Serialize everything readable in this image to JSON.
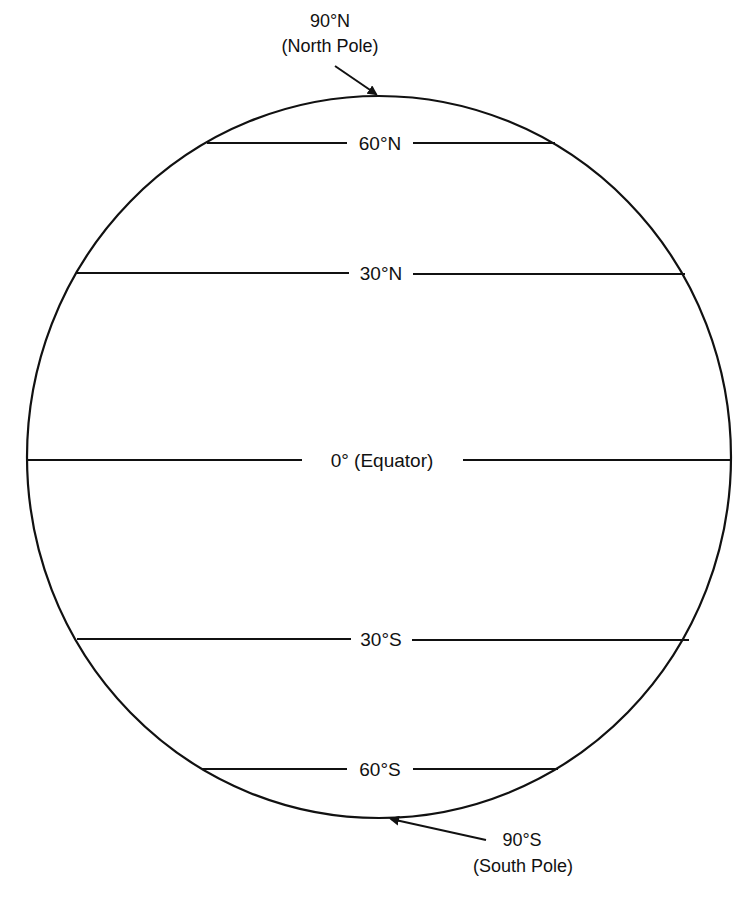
{
  "diagram": {
    "type": "globe-latitude-lines",
    "colors": {
      "stroke": "#111111",
      "background": "#ffffff"
    },
    "globe": {
      "cx": 379,
      "cy": 457,
      "rx": 352,
      "ry": 361
    },
    "north_pole": {
      "degree_label": "90°N",
      "name_label": "(North Pole)"
    },
    "south_pole": {
      "degree_label": "90°S",
      "name_label": "(South Pole)"
    },
    "latitudes": [
      {
        "id": "60n",
        "label": "60°N",
        "y": 143,
        "x1": 207,
        "x2": 555
      },
      {
        "id": "30n",
        "label": "30°N",
        "y": 273,
        "x1": 77,
        "x2": 685
      },
      {
        "id": "eq",
        "label": "0° (Equator)",
        "y": 460,
        "x1": 27,
        "x2": 731
      },
      {
        "id": "30s",
        "label": "30°S",
        "y": 639,
        "x1": 77,
        "x2": 689
      },
      {
        "id": "60s",
        "label": "60°S",
        "y": 769,
        "x1": 202,
        "x2": 558
      }
    ]
  }
}
